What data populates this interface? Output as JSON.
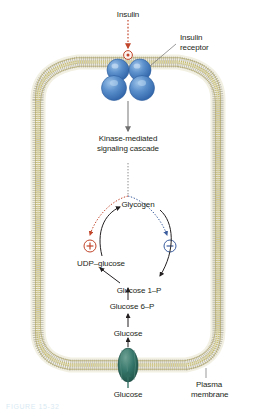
{
  "figure": {
    "colors": {
      "stimulate": "#c1452a",
      "inhibit": "#3b5d9e",
      "membrane_head": "#b5a642",
      "membrane_tail": "#a9a9a0",
      "membrane_fill": "#f2f0e2",
      "receptor": "#4a81c4",
      "transporter": "#2f6b5e",
      "arrow": "#231f20",
      "signal_arrow": "#8c8c8c",
      "background": "#ffffff"
    }
  },
  "labels": {
    "insulin": "Insulin",
    "insulin_receptor_line1": "Insulin",
    "insulin_receptor_line2": "receptor",
    "cascade_line1": "Kinase-mediated",
    "cascade_line2": "signaling cascade",
    "glycogen": "Glycogen",
    "udp_glucose": "UDP–glucose",
    "glucose_1_p": "Glucose 1–P",
    "glucose_6_p": "Glucose 6–P",
    "glucose_intracellular": "Glucose",
    "glucose_extracellular": "Glucose",
    "plasma_membrane_line1": "Plasma",
    "plasma_membrane_line2": "membrane",
    "stimulate_symbol": "+",
    "inhibit_symbol": "−"
  },
  "caption": "FIGURE 15-32"
}
